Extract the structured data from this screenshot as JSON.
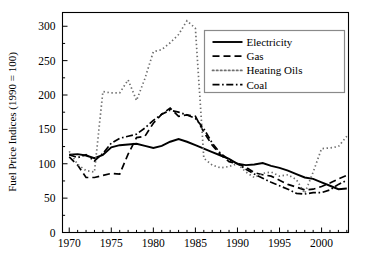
{
  "chart_data": {
    "type": "line",
    "title": "",
    "xlabel": "",
    "ylabel": "Fuel Price Indices (1990 = 100)",
    "xlim": [
      1969.2,
      2003.2
    ],
    "ylim": [
      0,
      320
    ],
    "xticks": [
      1970,
      1975,
      1980,
      1985,
      1990,
      1995,
      2000
    ],
    "xtick_labels": [
      "1970",
      "1975",
      "1980",
      "1985",
      "1990",
      "1995",
      "2000"
    ],
    "yticks": [
      0,
      50,
      100,
      150,
      200,
      250,
      300
    ],
    "ytick_labels": [
      "0",
      "50",
      "100",
      "150",
      "200",
      "250",
      "300"
    ],
    "grid": false,
    "legend_position": "upper right",
    "x": [
      1970,
      1971,
      1972,
      1973,
      1974,
      1975,
      1976,
      1977,
      1978,
      1979,
      1980,
      1981,
      1982,
      1983,
      1984,
      1985,
      1986,
      1987,
      1988,
      1989,
      1990,
      1991,
      1992,
      1993,
      1994,
      1995,
      1996,
      1997,
      1998,
      1999,
      2000,
      2001,
      2002,
      2003
    ],
    "series": [
      {
        "name": "Electricity",
        "style": "solid",
        "color": "#000000",
        "values": [
          113,
          114,
          112,
          108,
          113,
          124,
          127,
          128,
          129,
          126,
          123,
          126,
          132,
          136,
          132,
          127,
          122,
          117,
          112,
          107,
          100,
          98,
          99,
          101,
          97,
          94,
          90,
          85,
          80,
          78,
          73,
          68,
          63,
          64
        ]
      },
      {
        "name": "Gas",
        "style": "dashed",
        "color": "#000000",
        "values": [
          110,
          98,
          80,
          80,
          83,
          86,
          85,
          114,
          138,
          140,
          159,
          172,
          181,
          169,
          171,
          169,
          146,
          127,
          113,
          103,
          100,
          95,
          87,
          84,
          82,
          76,
          70,
          66,
          62,
          63,
          67,
          72,
          78,
          83
        ]
      },
      {
        "name": "Heating Oils",
        "style": "dotted",
        "color": "#6e6e6e",
        "values": [
          118,
          99,
          90,
          88,
          205,
          203,
          203,
          222,
          192,
          224,
          263,
          266,
          276,
          288,
          308,
          297,
          108,
          98,
          94,
          96,
          100,
          88,
          80,
          86,
          88,
          82,
          84,
          77,
          57,
          88,
          122,
          123,
          125,
          140
        ]
      },
      {
        "name": "Coal",
        "style": "dashdot",
        "color": "#000000",
        "values": [
          113,
          109,
          113,
          104,
          115,
          130,
          137,
          140,
          143,
          152,
          163,
          172,
          178,
          175,
          171,
          166,
          151,
          130,
          115,
          106,
          100,
          92,
          85,
          79,
          73,
          68,
          63,
          57,
          56,
          58,
          58,
          62,
          70,
          76
        ]
      }
    ],
    "legend": [
      {
        "label": "Electricity",
        "style": "solid",
        "color": "#000000"
      },
      {
        "label": "Gas",
        "style": "dashed",
        "color": "#000000"
      },
      {
        "label": "Heating Oils",
        "style": "dotted",
        "color": "#6e6e6e"
      },
      {
        "label": "Coal",
        "style": "dashdot",
        "color": "#000000"
      }
    ]
  }
}
